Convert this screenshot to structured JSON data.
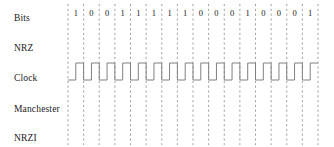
{
  "figure": {
    "width": 334,
    "height": 147,
    "background_color": "#ffffff",
    "line_color": "#808080",
    "grid_color": "#999999",
    "text_color": "#1a1a1a"
  },
  "rows": [
    {
      "id": "bits",
      "label": "Bits",
      "y": 14
    },
    {
      "id": "nrz",
      "label": "NRZ",
      "y": 44
    },
    {
      "id": "clock",
      "label": "Clock",
      "y": 74
    },
    {
      "id": "manchester",
      "label": "Manchester",
      "y": 105
    },
    {
      "id": "nrzi",
      "label": "NRZI",
      "y": 134
    }
  ],
  "chart_data": {
    "type": "line",
    "xlabel": "",
    "ylabel": "",
    "grid": true,
    "legend_position": "left",
    "bit_sequence": [
      1,
      0,
      0,
      1,
      1,
      1,
      1,
      1,
      0,
      0,
      0,
      1,
      0,
      0,
      0,
      1
    ],
    "bit_count": 16,
    "grid_x_start": 68,
    "grid_x_end": 318,
    "grid_y_start": 4,
    "grid_y_end": 145,
    "bit_cell_width": 15.625,
    "series": [
      {
        "name": "Bits",
        "kind": "labels",
        "values": [
          1,
          0,
          0,
          1,
          1,
          1,
          1,
          1,
          0,
          0,
          0,
          1,
          0,
          0,
          0,
          1
        ]
      },
      {
        "name": "NRZ",
        "kind": "waveform",
        "drawn": false,
        "values": []
      },
      {
        "name": "Clock",
        "kind": "waveform",
        "drawn": true,
        "high_y": 63,
        "low_y": 80,
        "description": "Square wave, one full period per bit cell, starts low then pulses high in second half of each cell",
        "values": [
          0,
          1,
          0,
          1,
          0,
          1,
          0,
          1,
          0,
          1,
          0,
          1,
          0,
          1,
          0,
          1,
          0,
          1,
          0,
          1,
          0,
          1,
          0,
          1,
          0,
          1,
          0,
          1,
          0,
          1,
          0,
          1
        ]
      },
      {
        "name": "Manchester",
        "kind": "waveform",
        "drawn": false,
        "values": []
      },
      {
        "name": "NRZI",
        "kind": "waveform",
        "drawn": false,
        "values": []
      }
    ]
  }
}
